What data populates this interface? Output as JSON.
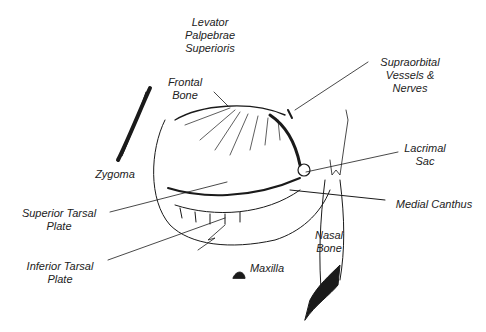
{
  "diagram": {
    "type": "anatomical-illustration",
    "labels": [
      {
        "id": "levator",
        "lines": [
          "Levator",
          "Palpebrae",
          "Superioris"
        ]
      },
      {
        "id": "frontal",
        "lines": [
          "Frontal",
          "Bone"
        ]
      },
      {
        "id": "supraorbital",
        "lines": [
          "Supraorbital",
          "Vessels &",
          "Nerves"
        ]
      },
      {
        "id": "zygoma",
        "lines": [
          "Zygoma"
        ]
      },
      {
        "id": "lacrimal",
        "lines": [
          "Lacrimal",
          "Sac"
        ]
      },
      {
        "id": "sup_tarsal",
        "lines": [
          "Superior Tarsal",
          "Plate"
        ]
      },
      {
        "id": "medial_canthus",
        "lines": [
          "Medial Canthus"
        ]
      },
      {
        "id": "inf_tarsal",
        "lines": [
          "Inferior Tarsal",
          "Plate"
        ]
      },
      {
        "id": "nasal",
        "lines": [
          "Nasal",
          "Bone"
        ]
      },
      {
        "id": "maxilla",
        "lines": [
          "Maxilla"
        ]
      }
    ],
    "colors": {
      "ink": "#1a1a1a",
      "background": "#ffffff"
    }
  }
}
